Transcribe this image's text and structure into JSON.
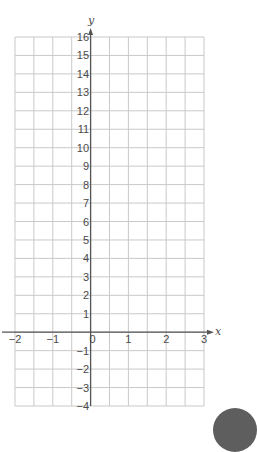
{
  "chart_data": {
    "type": "scatter",
    "title": "",
    "xlabel": "x",
    "ylabel": "y",
    "xlim": [
      -2,
      3
    ],
    "ylim": [
      -4,
      16
    ],
    "grid": true,
    "grid_x_step": 0.5,
    "grid_y_step": 1,
    "x_ticks": [
      -2,
      -1,
      0,
      1,
      2,
      3
    ],
    "x_tick_labels": [
      "−2",
      "−1",
      "0",
      "1",
      "2",
      "3"
    ],
    "y_ticks": [
      -4,
      -3,
      -2,
      -1,
      1,
      2,
      3,
      4,
      5,
      6,
      7,
      8,
      9,
      10,
      11,
      12,
      13,
      14,
      15,
      16
    ],
    "y_tick_labels": [
      "−4",
      "−3",
      "−2",
      "−1",
      "1",
      "2",
      "3",
      "4",
      "5",
      "6",
      "7",
      "8",
      "9",
      "10",
      "11",
      "12",
      "13",
      "14",
      "15",
      "16"
    ],
    "series": [],
    "legend": null
  },
  "colors": {
    "grid": "#c9c9c9",
    "axis": "#555555",
    "text": "#4a4a4a",
    "corner_circle": "#5e5e5e"
  }
}
